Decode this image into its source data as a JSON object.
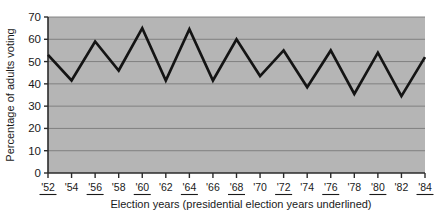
{
  "chart_data": {
    "type": "line",
    "title": "",
    "xlabel": "Election years (presidential election years underlined)",
    "ylabel": "Percentage of adults voting",
    "categories": [
      "'52",
      "'54",
      "'56",
      "'58",
      "'60",
      "'62",
      "'64",
      "'66",
      "'68",
      "'70",
      "'72",
      "'74",
      "'76",
      "'78",
      "'80",
      "'82",
      "'84"
    ],
    "values": [
      53,
      41.5,
      59,
      46,
      65,
      41.5,
      64.5,
      41.5,
      60,
      43.5,
      55,
      38.5,
      55,
      35.5,
      54,
      34.5,
      52
    ],
    "underlined_categories": [
      "'52",
      "'56",
      "'60",
      "'64",
      "'68",
      "'72",
      "'76",
      "'80",
      "'84"
    ],
    "ylim": [
      0,
      70
    ],
    "ytick_values": [
      0,
      10,
      20,
      30,
      40,
      50,
      60,
      70
    ],
    "ytick_labels": [
      "0",
      "10",
      "20",
      "30",
      "40",
      "50",
      "60",
      "70"
    ],
    "grid": true,
    "legend": "none",
    "colors": {
      "plot_background": "#b5b5b5",
      "gridline": "#7a7a7a",
      "axis": "#2b2b2b",
      "series_line": "#141414",
      "page_background": "#ffffff",
      "text": "#1a1a1a"
    },
    "series": [
      {
        "name": "Percentage of adults voting",
        "values": [
          53,
          41.5,
          59,
          46,
          65,
          41.5,
          64.5,
          41.5,
          60,
          43.5,
          55,
          38.5,
          55,
          35.5,
          54,
          34.5,
          52
        ]
      }
    ]
  }
}
